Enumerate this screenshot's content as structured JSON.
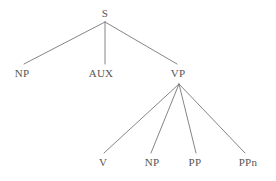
{
  "figure": {
    "kind": "syntax-parse-tree",
    "background_color": "#ffffff",
    "line_color": "#777777",
    "text_color": "#555555"
  },
  "nodes": {
    "s": {
      "label": "S",
      "x": 105,
      "y": 14
    },
    "np_subject": {
      "label": "NP",
      "x": 22,
      "y": 74
    },
    "aux": {
      "label": "AUX",
      "x": 101,
      "y": 74
    },
    "vp": {
      "label": "VP",
      "x": 178,
      "y": 74
    },
    "v": {
      "label": "V",
      "x": 103,
      "y": 163
    },
    "np_object": {
      "label": "NP",
      "x": 152,
      "y": 163
    },
    "pp": {
      "label": "PP",
      "x": 195,
      "y": 163
    },
    "ppn": {
      "label": "PPn",
      "x": 248,
      "y": 163
    }
  },
  "edges": [
    {
      "name": "s-to-np",
      "x1": 105,
      "y1": 22,
      "x2": 24,
      "y2": 64
    },
    {
      "name": "s-to-aux",
      "x1": 105,
      "y1": 22,
      "x2": 105,
      "y2": 64
    },
    {
      "name": "s-to-vp",
      "x1": 105,
      "y1": 22,
      "x2": 177,
      "y2": 64
    },
    {
      "name": "vp-to-v",
      "x1": 179,
      "y1": 84,
      "x2": 104,
      "y2": 153
    },
    {
      "name": "vp-to-np",
      "x1": 179,
      "y1": 84,
      "x2": 151,
      "y2": 153
    },
    {
      "name": "vp-to-pp",
      "x1": 179,
      "y1": 84,
      "x2": 196,
      "y2": 153
    },
    {
      "name": "vp-to-ppn",
      "x1": 179,
      "y1": 84,
      "x2": 245,
      "y2": 153
    }
  ]
}
